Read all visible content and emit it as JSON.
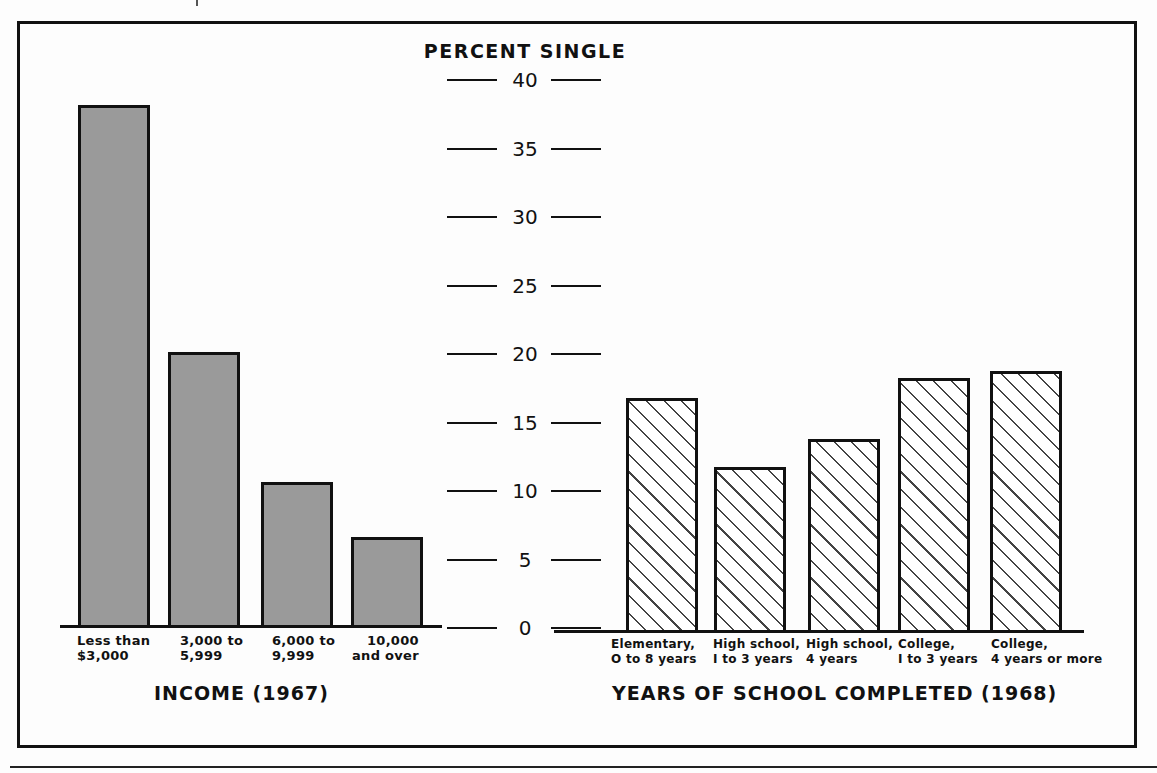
{
  "chart_data": [
    {
      "type": "bar",
      "title": "",
      "xlabel": "INCOME (1967)",
      "ylabel": "PERCENT SINGLE",
      "categories": [
        "Less than\n$3,000",
        "3,000 to\n5,999",
        "6,000 to\n9,999",
        "10,000\nand over"
      ],
      "values": [
        38,
        20,
        10.5,
        6.5
      ],
      "fill": "solid-gray",
      "ylim": [
        0,
        40
      ],
      "grid": false
    },
    {
      "type": "bar",
      "title": "",
      "xlabel": "YEARS OF SCHOOL COMPLETED (1968)",
      "ylabel": "PERCENT SINGLE",
      "categories": [
        "Elementary,\n0 to 8 years",
        "High school,\n1 to 3 years",
        "High school,\n4 years",
        "College,\n1 to 3 years",
        "College,\n4 years or more"
      ],
      "values": [
        17,
        12,
        14,
        18.5,
        19
      ],
      "fill": "diagonal-hatch",
      "ylim": [
        0,
        40
      ],
      "grid": false
    }
  ],
  "axis": {
    "title": "PERCENT SINGLE",
    "ticks": [
      "40",
      "35",
      "30",
      "25",
      "20",
      "15",
      "10",
      "5",
      "0"
    ]
  },
  "income": {
    "xlabel": "INCOME (1967)",
    "categories": [
      "Less than\n$3,000",
      "3,000 to\n5,999",
      "6,000 to\n9,999",
      "10,000\nand over"
    ]
  },
  "school": {
    "xlabel": "YEARS OF SCHOOL COMPLETED (1968)",
    "categories": [
      "Elementary,\nO to 8 years",
      "High school,\nI to 3 years",
      "High school,\n4 years",
      "College,\nI to 3 years",
      "College,\n4 years or more"
    ]
  },
  "colors": {
    "ink": "#111111",
    "bar_fill": "#9a9a9a",
    "background": "#fdfdfd"
  }
}
